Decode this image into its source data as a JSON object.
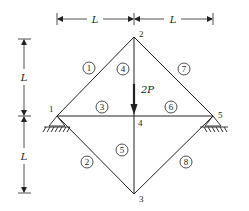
{
  "diagram": {
    "type": "truss",
    "dimensions": {
      "horizontal": [
        {
          "label": "L",
          "from_node": 1,
          "to_node": 2
        },
        {
          "label": "L",
          "from_node": 2,
          "to_node": 5
        }
      ],
      "vertical": [
        {
          "label": "L",
          "from_node": 2,
          "to_node": 4
        },
        {
          "label": "L",
          "from_node": 4,
          "to_node": 3
        }
      ]
    },
    "nodes": [
      {
        "id": "1",
        "label": "1",
        "x": 57,
        "y": 116,
        "support": "pin"
      },
      {
        "id": "2",
        "label": "2",
        "x": 134,
        "y": 37
      },
      {
        "id": "3",
        "label": "3",
        "x": 134,
        "y": 194
      },
      {
        "id": "4",
        "label": "4",
        "x": 134,
        "y": 116
      },
      {
        "id": "5",
        "label": "5",
        "x": 213,
        "y": 116,
        "support": "pin"
      }
    ],
    "members": [
      {
        "id": "1",
        "label": "1",
        "from": "1",
        "to": "2"
      },
      {
        "id": "2",
        "label": "2",
        "from": "1",
        "to": "3"
      },
      {
        "id": "3",
        "label": "3",
        "from": "1",
        "to": "4"
      },
      {
        "id": "4",
        "label": "4",
        "from": "2",
        "to": "4"
      },
      {
        "id": "5",
        "label": "5",
        "from": "4",
        "to": "3"
      },
      {
        "id": "6",
        "label": "6",
        "from": "4",
        "to": "5"
      },
      {
        "id": "7",
        "label": "7",
        "from": "2",
        "to": "5"
      },
      {
        "id": "8",
        "label": "8",
        "from": "3",
        "to": "5"
      }
    ],
    "load": {
      "label": "2P",
      "node": "4",
      "direction": "down"
    }
  }
}
